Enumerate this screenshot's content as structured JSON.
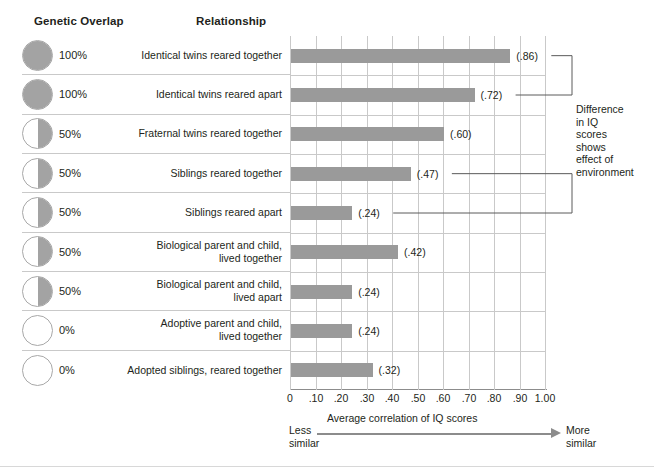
{
  "headers": {
    "genetic_overlap": "Genetic Overlap",
    "relationship": "Relationship"
  },
  "annotation": {
    "lines": [
      "Difference",
      "in IQ",
      "scores",
      "shows",
      "effect of",
      "environment"
    ]
  },
  "axis": {
    "caption": "Average correlation of IQ scores",
    "less_similar": [
      "Less",
      "similar"
    ],
    "more_similar": [
      "More",
      "similar"
    ],
    "tick_labels": [
      "0",
      ".10",
      ".20",
      ".30",
      ".40",
      ".50",
      ".60",
      ".70",
      ".80",
      ".90",
      "1.00"
    ]
  },
  "rows": [
    {
      "overlap_label": "100%",
      "overlap_value": 100,
      "circle": "full",
      "relationship_lines": [
        "Identical twins reared together"
      ],
      "value": 0.86,
      "value_label": "(.86)"
    },
    {
      "overlap_label": "100%",
      "overlap_value": 100,
      "circle": "full",
      "relationship_lines": [
        "Identical twins reared apart"
      ],
      "value": 0.72,
      "value_label": "(.72)"
    },
    {
      "overlap_label": "50%",
      "overlap_value": 50,
      "circle": "half",
      "relationship_lines": [
        "Fraternal twins reared together"
      ],
      "value": 0.6,
      "value_label": "(.60)"
    },
    {
      "overlap_label": "50%",
      "overlap_value": 50,
      "circle": "half",
      "relationship_lines": [
        "Siblings reared together"
      ],
      "value": 0.47,
      "value_label": "(.47)"
    },
    {
      "overlap_label": "50%",
      "overlap_value": 50,
      "circle": "half",
      "relationship_lines": [
        "Siblings reared apart"
      ],
      "value": 0.24,
      "value_label": "(.24)"
    },
    {
      "overlap_label": "50%",
      "overlap_value": 50,
      "circle": "half",
      "relationship_lines": [
        "Biological parent and child,",
        "lived together"
      ],
      "value": 0.42,
      "value_label": "(.42)"
    },
    {
      "overlap_label": "50%",
      "overlap_value": 50,
      "circle": "half",
      "relationship_lines": [
        "Biological parent and child,",
        "lived apart"
      ],
      "value": 0.24,
      "value_label": "(.24)"
    },
    {
      "overlap_label": "0%",
      "overlap_value": 0,
      "circle": "empty",
      "relationship_lines": [
        "Adoptive parent and child,",
        "lived together"
      ],
      "value": 0.24,
      "value_label": "(.24)"
    },
    {
      "overlap_label": "0%",
      "overlap_value": 0,
      "circle": "empty",
      "relationship_lines": [
        "Adopted siblings, reared together"
      ],
      "value": 0.32,
      "value_label": "(.32)"
    }
  ],
  "colors": {
    "bar": "#9a9a9a",
    "circle_fill": "#a3a3a3",
    "gridline": "#c9c9c9",
    "axis": "#8c8c8c",
    "text": "#231f20"
  },
  "chart_data": {
    "type": "bar",
    "orientation": "horizontal",
    "title": "",
    "xlabel": "Average correlation of IQ scores",
    "ylabel": "",
    "xlim": [
      0,
      1.0
    ],
    "xticks": [
      0,
      0.1,
      0.2,
      0.3,
      0.4,
      0.5,
      0.6,
      0.7,
      0.8,
      0.9,
      1.0
    ],
    "xtick_labels": [
      "0",
      ".10",
      ".20",
      ".30",
      ".40",
      ".50",
      ".60",
      ".70",
      ".80",
      ".90",
      "1.00"
    ],
    "grid": true,
    "legend": "none",
    "categories": [
      "Identical twins reared together",
      "Identical twins reared apart",
      "Fraternal twins reared together",
      "Siblings reared together",
      "Siblings reared apart",
      "Biological parent and child, lived together",
      "Biological parent and child, lived apart",
      "Adoptive parent and child, lived together",
      "Adopted siblings, reared together"
    ],
    "values": [
      0.86,
      0.72,
      0.6,
      0.47,
      0.24,
      0.42,
      0.24,
      0.24,
      0.32
    ],
    "data_labels": [
      "(.86)",
      "(.72)",
      "(.60)",
      "(.47)",
      "(.24)",
      "(.42)",
      "(.24)",
      "(.24)",
      "(.32)"
    ],
    "genetic_overlap_percent": [
      100,
      100,
      50,
      50,
      50,
      50,
      50,
      0,
      0
    ],
    "annotations": [
      {
        "text": "Difference in IQ scores shows effect of environment",
        "brackets": [
          {
            "from_category": "Identical twins reared together",
            "to_category": "Identical twins reared apart"
          },
          {
            "from_category": "Siblings reared together",
            "to_category": "Siblings reared apart"
          }
        ]
      },
      {
        "text": "Less similar",
        "position": "x-axis-left"
      },
      {
        "text": "More similar",
        "position": "x-axis-right"
      }
    ]
  }
}
